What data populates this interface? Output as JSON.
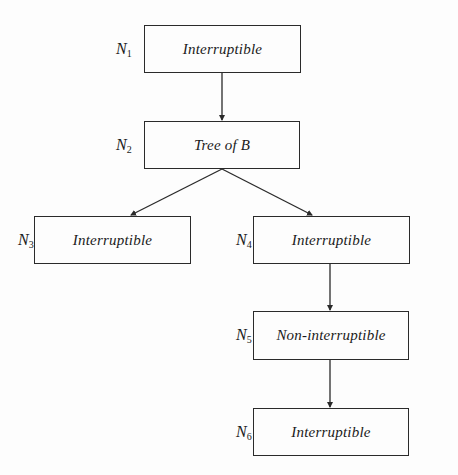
{
  "diagram": {
    "type": "tree",
    "nodes": [
      {
        "id": "N1",
        "label_main": "N",
        "label_sub": "1",
        "text": "Interruptible",
        "box": {
          "x": 144,
          "y": 25,
          "w": 157,
          "h": 48
        }
      },
      {
        "id": "N2",
        "label_main": "N",
        "label_sub": "2",
        "text": "Tree of B",
        "box": {
          "x": 144,
          "y": 121,
          "w": 156,
          "h": 48
        }
      },
      {
        "id": "N3",
        "label_main": "N",
        "label_sub": "3",
        "text": "Interruptible",
        "box": {
          "x": 34,
          "y": 216,
          "w": 157,
          "h": 48
        }
      },
      {
        "id": "N4",
        "label_main": "N",
        "label_sub": "4",
        "text": "Interruptible",
        "box": {
          "x": 253,
          "y": 216,
          "w": 157,
          "h": 48
        }
      },
      {
        "id": "N5",
        "label_main": "N",
        "label_sub": "5",
        "text": "Non-interruptible",
        "box": {
          "x": 253,
          "y": 311,
          "w": 156,
          "h": 49
        }
      },
      {
        "id": "N6",
        "label_main": "N",
        "label_sub": "6",
        "text": "Interruptible",
        "box": {
          "x": 253,
          "y": 408,
          "w": 156,
          "h": 48
        }
      }
    ],
    "edges": [
      {
        "from": "N1",
        "to": "N2",
        "x1": 222,
        "y1": 73,
        "x2": 222,
        "y2": 121
      },
      {
        "from": "N2",
        "to": "N3",
        "x1": 222,
        "y1": 169,
        "x2": 130,
        "y2": 216
      },
      {
        "from": "N2",
        "to": "N4",
        "x1": 222,
        "y1": 169,
        "x2": 313,
        "y2": 216
      },
      {
        "from": "N4",
        "to": "N5",
        "x1": 330,
        "y1": 264,
        "x2": 330,
        "y2": 311
      },
      {
        "from": "N5",
        "to": "N6",
        "x1": 330,
        "y1": 360,
        "x2": 330,
        "y2": 408
      }
    ],
    "colors": {
      "line": "#2a2a2a",
      "text": "#1a1a1a",
      "background": "#fdfdfd"
    }
  }
}
